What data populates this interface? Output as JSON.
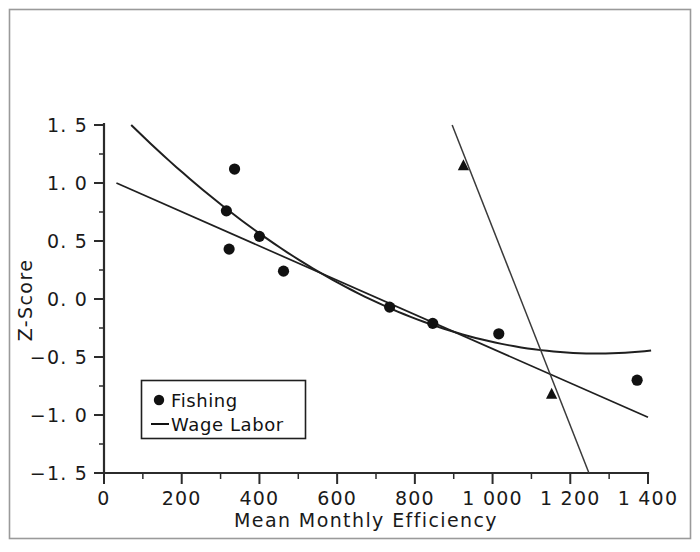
{
  "chart_data": {
    "type": "scatter",
    "title": "",
    "xlabel": "Mean Monthly Efficiency",
    "ylabel": "Z-Score",
    "xlim": [
      0,
      1400
    ],
    "ylim": [
      -1.5,
      1.5
    ],
    "grid": false,
    "legend_position": "lower-left",
    "x_ticks": [
      0,
      200,
      400,
      600,
      800,
      1000,
      1200,
      1400
    ],
    "x_tick_labels": [
      "0",
      "200",
      "400",
      "600",
      "800",
      "1 000",
      "1 200",
      "1 400"
    ],
    "x_minor_tick_step": 100,
    "y_ticks": [
      -1.5,
      -1.0,
      -0.5,
      0.0,
      0.5,
      1.0,
      1.5
    ],
    "y_tick_labels": [
      "-1.5",
      "-1.0",
      "-0.5",
      "0.0",
      "0.5",
      "1.0",
      "1.5"
    ],
    "y_minor_tick_step": 0.25,
    "series": [
      {
        "name": "Fishing",
        "marker": "circle",
        "points": [
          {
            "x": 315,
            "y": 0.76
          },
          {
            "x": 322,
            "y": 0.43
          },
          {
            "x": 336,
            "y": 1.12
          },
          {
            "x": 400,
            "y": 0.54
          },
          {
            "x": 462,
            "y": 0.24
          },
          {
            "x": 735,
            "y": -0.07
          },
          {
            "x": 846,
            "y": -0.21
          },
          {
            "x": 1016,
            "y": -0.3
          },
          {
            "x": 1372,
            "y": -0.7
          }
        ]
      },
      {
        "name": "Wage Labor",
        "marker": "triangle",
        "points": [
          {
            "x": 925,
            "y": 1.15
          },
          {
            "x": 1152,
            "y": -0.82
          }
        ]
      }
    ],
    "fit_lines": [
      {
        "name": "fishing-linear-fit",
        "kind": "line",
        "x_start": 32,
        "y_start": 1.0,
        "x_end": 1400,
        "y_end": -1.02
      },
      {
        "name": "fishing-quadratic-fit",
        "kind": "curve",
        "x_start": 70,
        "y_start": 1.5,
        "x_end": 1408,
        "y_end": -0.44,
        "vertex_x": 1270,
        "vertex_y": -0.47
      },
      {
        "name": "wage-labor-fit",
        "kind": "line",
        "x_start": 896,
        "y_start": 1.5,
        "x_end": 1248,
        "y_end": -1.5
      }
    ],
    "legend_entries": [
      {
        "label": "Fishing",
        "marker": "circle"
      },
      {
        "label": "Wage Labor",
        "marker": "line"
      }
    ]
  }
}
